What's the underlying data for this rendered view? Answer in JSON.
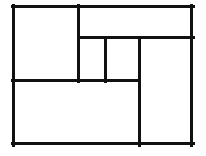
{
  "figure": {
    "canvas": {
      "width": 206,
      "height": 156
    },
    "background_color": "#ffffff",
    "line_color": "#111111",
    "line_style": "hand-drawn-ink",
    "outer_rect": {
      "x1": 12,
      "y1": 5,
      "x2": 193,
      "y2": 145,
      "stroke_width": 3
    },
    "segments": [
      {
        "name": "outer-top-edge",
        "orientation": "horizontal",
        "x1": 12,
        "y1": 5,
        "x2": 193,
        "y2": 5,
        "stroke_width": 3
      },
      {
        "name": "outer-right-edge",
        "orientation": "vertical",
        "x1": 193,
        "y1": 5,
        "x2": 193,
        "y2": 145,
        "stroke_width": 3
      },
      {
        "name": "outer-bottom-edge",
        "orientation": "horizontal",
        "x1": 12,
        "y1": 145,
        "x2": 193,
        "y2": 145,
        "stroke_width": 3
      },
      {
        "name": "outer-left-edge",
        "orientation": "vertical",
        "x1": 12,
        "y1": 5,
        "x2": 12,
        "y2": 145,
        "stroke_width": 3
      },
      {
        "name": "divider-vertical-left",
        "orientation": "vertical",
        "x1": 78,
        "y1": 5,
        "x2": 78,
        "y2": 81,
        "stroke_width": 3
      },
      {
        "name": "divider-horizontal-upper",
        "orientation": "horizontal",
        "x1": 78,
        "y1": 37,
        "x2": 193,
        "y2": 37,
        "stroke_width": 3
      },
      {
        "name": "divider-vertical-middle",
        "orientation": "vertical",
        "x1": 105,
        "y1": 37,
        "x2": 105,
        "y2": 81,
        "stroke_width": 3
      },
      {
        "name": "divider-vertical-right",
        "orientation": "vertical",
        "x1": 139,
        "y1": 37,
        "x2": 139,
        "y2": 145,
        "stroke_width": 3
      },
      {
        "name": "divider-horizontal-lower",
        "orientation": "horizontal",
        "x1": 12,
        "y1": 80,
        "x2": 139,
        "y2": 80,
        "stroke_width": 3
      }
    ],
    "regions": [
      {
        "name": "region-top-left",
        "label": "",
        "x": 12,
        "y": 5,
        "width": 66,
        "height": 75
      },
      {
        "name": "region-top-right",
        "label": "",
        "x": 78,
        "y": 5,
        "width": 115,
        "height": 32
      },
      {
        "name": "region-middle-small",
        "label": "",
        "x": 78,
        "y": 37,
        "width": 27,
        "height": 43
      },
      {
        "name": "region-middle-inner",
        "label": "",
        "x": 105,
        "y": 37,
        "width": 34,
        "height": 43
      },
      {
        "name": "region-bottom-left",
        "label": "",
        "x": 12,
        "y": 80,
        "width": 127,
        "height": 65
      },
      {
        "name": "region-right-tall",
        "label": "",
        "x": 139,
        "y": 37,
        "width": 54,
        "height": 108
      }
    ]
  }
}
